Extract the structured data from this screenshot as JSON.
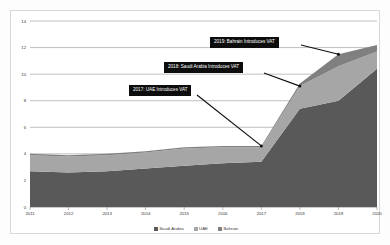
{
  "chart_data": {
    "type": "area",
    "stacked": true,
    "title": "",
    "xlabel": "",
    "ylabel": "",
    "categories": [
      "2011",
      "2012",
      "2013",
      "2014",
      "2015",
      "2016",
      "2017",
      "2018",
      "2019",
      "2020"
    ],
    "x_tick_labels": [
      "2011",
      "2012",
      "2013",
      "2014",
      "2015",
      "2016",
      "2017",
      "2018",
      "2019",
      "2020"
    ],
    "y_tick_labels": [
      "0",
      "2",
      "4",
      "6",
      "8",
      "10",
      "12",
      "14"
    ],
    "y_tick_values": [
      0,
      2,
      4,
      6,
      8,
      10,
      12,
      14
    ],
    "ylim": [
      0,
      14
    ],
    "grid": true,
    "grid_axis": "y",
    "legend_position": "bottom",
    "series": [
      {
        "name": "Saudi Arabia",
        "color": "#595959",
        "values": [
          2.7,
          2.6,
          2.7,
          2.9,
          3.1,
          3.3,
          3.4,
          7.4,
          8.0,
          10.4
        ]
      },
      {
        "name": "UAE",
        "color": "#a6a6a6",
        "values": [
          1.2,
          1.2,
          1.2,
          1.2,
          1.3,
          1.2,
          1.1,
          1.7,
          2.6,
          1.3
        ]
      },
      {
        "name": "Bahrain",
        "color": "#808080",
        "values": [
          0.1,
          0.1,
          0.1,
          0.1,
          0.1,
          0.1,
          0.1,
          0.2,
          0.9,
          0.5
        ]
      }
    ],
    "annotations": [
      {
        "id": "ann-2017-uae",
        "label": "2017: UAE Introduces VAT",
        "target_category": "2017",
        "target_value": 4.6
      },
      {
        "id": "ann-2018-saudi",
        "label": "2018: Saudi Arabia Introduces VAT",
        "target_category": "2018",
        "target_value": 9.1
      },
      {
        "id": "ann-2019-bahrain",
        "label": "2019: Bahrain Introduces VAT",
        "target_category": "2019",
        "target_value": 11.5
      }
    ]
  },
  "axis": {
    "y_labels": [
      "14",
      "12",
      "10",
      "8",
      "6",
      "4",
      "2",
      "0"
    ],
    "x_labels": [
      "2011",
      "2012",
      "2013",
      "2014",
      "2015",
      "2016",
      "2017",
      "2018",
      "2019",
      "2020"
    ]
  },
  "legend": {
    "items": [
      {
        "label": "Saudi Arabia",
        "color": "#595959"
      },
      {
        "label": "UAE",
        "color": "#a6a6a6"
      },
      {
        "label": "Bahrain",
        "color": "#808080"
      }
    ]
  },
  "annotations": {
    "bahrain": "2019: Bahrain Introduces VAT",
    "saudi": "2018: Saudi Arabia Introduces VAT",
    "uae": "2017: UAE Introduces VAT"
  },
  "colors": {
    "saudi": "#595959",
    "uae": "#a6a6a6",
    "bahrain": "#808080",
    "gridline": "#8c8c8c",
    "callout_bg": "#0d0d0d",
    "callout_text": "#ffffff",
    "frame_border": "#d8d8d8",
    "background": "#ffffff"
  }
}
